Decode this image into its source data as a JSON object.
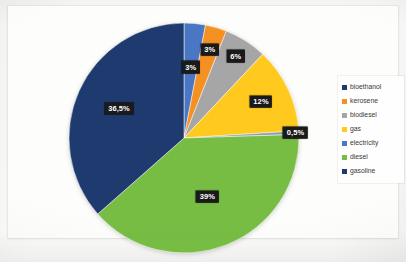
{
  "figure": {
    "caption": ""
  },
  "legend": {
    "position": "right",
    "items": [
      {
        "label": "bioethanol",
        "color": "#1F3A6E"
      },
      {
        "label": "kerosene",
        "color": "#F59022"
      },
      {
        "label": "biodiesel",
        "color": "#A6A6A6"
      },
      {
        "label": "gas",
        "color": "#FFC91E"
      },
      {
        "label": "electricity",
        "color": "#4A77C4"
      },
      {
        "label": "diesel",
        "color": "#77BC43"
      },
      {
        "label": "gasoline",
        "color": "#1F3A6E"
      }
    ]
  },
  "chart_data": {
    "type": "pie",
    "title": "",
    "xlabel": "",
    "ylabel": "",
    "start_angle_deg": 0,
    "direction": "clockwise",
    "categories": [
      "bioethanol",
      "kerosene",
      "biodiesel",
      "gas",
      "electricity",
      "diesel",
      "gasoline"
    ],
    "values": [
      3,
      3,
      6,
      12,
      0.5,
      39,
      36.5
    ],
    "labels": [
      "3%",
      "3%",
      "6%",
      "12%",
      "0,5%",
      "39%",
      "36,5%"
    ],
    "colors": [
      "#4A77C4",
      "#F59022",
      "#A6A6A6",
      "#FFC91E",
      "#8C9CA8",
      "#77BC43",
      "#1F3A6E"
    ],
    "unit": "%",
    "total": 100,
    "legend": [
      "bioethanol",
      "kerosene",
      "biodiesel",
      "gas",
      "electricity",
      "diesel",
      "gasoline"
    ]
  }
}
